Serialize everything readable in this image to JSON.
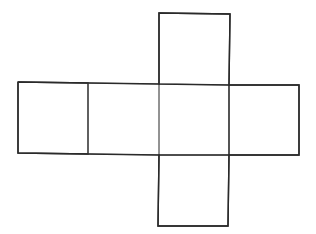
{
  "diagram": {
    "type": "cube-net",
    "colors": {
      "background": "#ffffff",
      "stroke": "#2a2a2a"
    },
    "faces": [
      {
        "id": "left",
        "points": "18,82 88,83 88,154 18,153"
      },
      {
        "id": "center-left",
        "points": "88,83 159,84 159,155 88,154"
      },
      {
        "id": "center",
        "points": "159,84 229,85 229,155 159,155"
      },
      {
        "id": "right",
        "points": "229,85 299,85 299,155 229,155"
      },
      {
        "id": "top",
        "points": "159,13 230,14 229,85 159,84"
      },
      {
        "id": "bottom",
        "points": "159,155 229,155 228,226 158,226"
      }
    ]
  }
}
